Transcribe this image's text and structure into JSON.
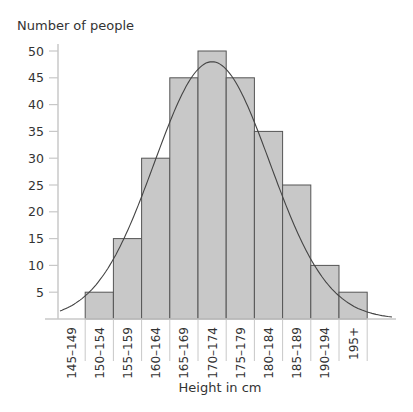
{
  "chart_data": {
    "type": "bar",
    "title": "",
    "xlabel": "Height in cm",
    "ylabel": "Number of people",
    "categories": [
      "145–149",
      "150–154",
      "155–159",
      "160–164",
      "165–169",
      "170–174",
      "175–179",
      "180–184",
      "185–189",
      "190–194",
      "195+"
    ],
    "values": [
      0,
      5,
      15,
      30,
      45,
      50,
      45,
      35,
      25,
      10,
      5
    ],
    "yticks": [
      5,
      10,
      15,
      20,
      25,
      30,
      35,
      40,
      45,
      50
    ],
    "ylim": [
      0,
      50
    ],
    "grid": false,
    "legend": null,
    "overlay": "normal distribution curve",
    "bar_color": "#c8c8c8",
    "bar_edge_color": "#555555",
    "curve_color": "#444444"
  }
}
